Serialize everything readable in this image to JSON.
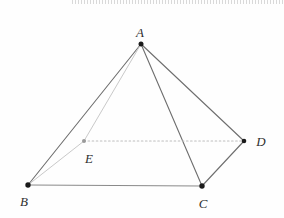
{
  "figure": {
    "kind": "geometry-pyramid",
    "width": 284,
    "height": 218,
    "background": "#fefefe"
  },
  "colors": {
    "edge_solid": "#6e6e6e",
    "edge_base": "#8a8a8a",
    "edge_hidden": "#c9c9c9",
    "edge_dotted": "#bdbdbd",
    "dot_black": "#1a1a1a",
    "dot_gray": "#9a9a9a",
    "label": "#2f2f2f",
    "top_artifact": "#aaaaaa"
  },
  "points": [
    {
      "id": "A",
      "label": "A",
      "x": 141,
      "y": 44,
      "label_x": 140,
      "label_y": 37,
      "dot_r": 2.5,
      "dot": "dot_black"
    },
    {
      "id": "B",
      "label": "B",
      "x": 28,
      "y": 185,
      "label_x": 24,
      "label_y": 206,
      "dot_r": 2.7,
      "dot": "dot_black"
    },
    {
      "id": "C",
      "label": "C",
      "x": 202,
      "y": 186,
      "label_x": 203,
      "label_y": 208,
      "dot_r": 2.7,
      "dot": "dot_black"
    },
    {
      "id": "D",
      "label": "D",
      "x": 244,
      "y": 141,
      "label_x": 261,
      "label_y": 146,
      "dot_r": 2.3,
      "dot": "dot_black"
    },
    {
      "id": "E",
      "label": "E",
      "x": 84,
      "y": 141,
      "label_x": 89,
      "label_y": 163,
      "dot_r": 2.0,
      "dot": "dot_gray"
    }
  ],
  "edges": [
    {
      "from": "A",
      "to": "B",
      "style": "solid"
    },
    {
      "from": "A",
      "to": "C",
      "style": "solid"
    },
    {
      "from": "A",
      "to": "D",
      "style": "solid"
    },
    {
      "from": "B",
      "to": "C",
      "style": "base"
    },
    {
      "from": "C",
      "to": "D",
      "style": "solid"
    },
    {
      "from": "A",
      "to": "E",
      "style": "hidden"
    },
    {
      "from": "B",
      "to": "E",
      "style": "hidden"
    },
    {
      "from": "E",
      "to": "D",
      "style": "dotted"
    }
  ]
}
